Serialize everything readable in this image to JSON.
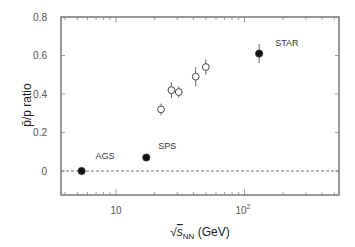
{
  "chart_data": {
    "type": "scatter",
    "title": "",
    "xlabel": "√s_NN (GeV)",
    "xlabel_parts": {
      "root": "√",
      "s": "s",
      "sub": "NN",
      "unit": " (GeV)"
    },
    "ylabel": "p̄/p ratio",
    "xscale": "log",
    "xlim": [
      3.75,
      540
    ],
    "ylim": [
      -0.125,
      0.8
    ],
    "yticks": [
      "0",
      "0.2",
      "0.4",
      "0.6",
      "0.8"
    ],
    "xticks": [
      "10",
      "10^2"
    ],
    "xtick_labels": {
      "ten": "10",
      "hundred_base": "10",
      "hundred_exp": "2"
    },
    "reference_line": {
      "y": 0,
      "style": "dashed"
    },
    "series": [
      {
        "name": "Labeled experiments",
        "marker": "filled-circle",
        "points": [
          {
            "label": "AGS",
            "x": 5.4,
            "y": 0.0,
            "err": 0.0
          },
          {
            "label": "SPS",
            "x": 17.2,
            "y": 0.07,
            "err": 0.0
          },
          {
            "label": "STAR",
            "x": 130,
            "y": 0.61,
            "err": 0.05
          }
        ]
      },
      {
        "name": "Intermediate measurements",
        "marker": "open-circle",
        "points": [
          {
            "x": 22.4,
            "y": 0.32,
            "err": 0.03
          },
          {
            "x": 27.0,
            "y": 0.42,
            "err": 0.04
          },
          {
            "x": 30.8,
            "y": 0.41,
            "err": 0.03
          },
          {
            "x": 41.7,
            "y": 0.49,
            "err": 0.05
          },
          {
            "x": 50.0,
            "y": 0.54,
            "err": 0.04
          }
        ]
      }
    ],
    "grid": false,
    "legend": "none"
  }
}
